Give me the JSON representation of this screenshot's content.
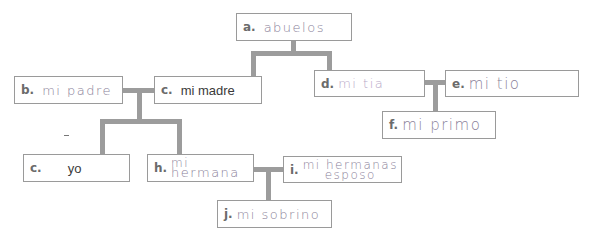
{
  "diagram": {
    "nodes": {
      "a": {
        "letter": "a.",
        "text": "abuelos"
      },
      "b": {
        "letter": "b.",
        "text": "mi padre"
      },
      "c_madre": {
        "letter": "c.",
        "text": "mi madre"
      },
      "d": {
        "letter": "d.",
        "text": "mi tia"
      },
      "e": {
        "letter": "e.",
        "text": "mi tio"
      },
      "f": {
        "letter": "f.",
        "text": "mi primo"
      },
      "c_yo": {
        "letter": "c.",
        "text": "yo"
      },
      "h": {
        "letter": "h.",
        "text_line1": "mi",
        "text_line2": "hermana"
      },
      "i": {
        "letter": "i.",
        "text_line1": "mi hermanas",
        "text_line2": "esposo"
      },
      "j": {
        "letter": "j.",
        "text": "mi sobrino"
      }
    },
    "colors": {
      "box_border": "#9a9a9a",
      "connector": "#9c9c9c",
      "handwriting": "#8a7f99",
      "letter": "#6b6b6b"
    }
  }
}
